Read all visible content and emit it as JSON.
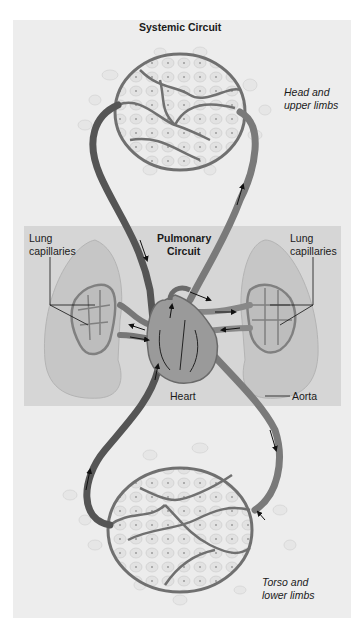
{
  "diagram": {
    "title": "Systemic Circuit",
    "pulmonary_title_line1": "Pulmonary",
    "pulmonary_title_line2": "Circuit",
    "labels": {
      "head_line1": "Head and",
      "head_line2": "upper limbs",
      "lung_left_line1": "Lung",
      "lung_left_line2": "capillaries",
      "lung_right_line1": "Lung",
      "lung_right_line2": "capillaries",
      "heart": "Heart",
      "aorta": "Aorta",
      "torso_line1": "Torso and",
      "torso_line2": "lower limbs"
    },
    "regions": [
      {
        "name": "Systemic Circuit",
        "parts": [
          "Head and upper limbs",
          "Torso and lower limbs"
        ]
      },
      {
        "name": "Pulmonary Circuit",
        "parts": [
          "Lung capillaries (left)",
          "Lung capillaries (right)"
        ]
      }
    ],
    "structures": [
      "Heart",
      "Aorta"
    ],
    "colors": {
      "panel_bg": "#ededed",
      "pulmonary_bg": "#d6d6d6",
      "vessel_dark": "#5a5a5a",
      "vessel_light": "#8a8a8a",
      "lung_fill": "#c4c4c4",
      "cell_fill": "#e4e4e4",
      "text": "#1a1a1a"
    }
  }
}
